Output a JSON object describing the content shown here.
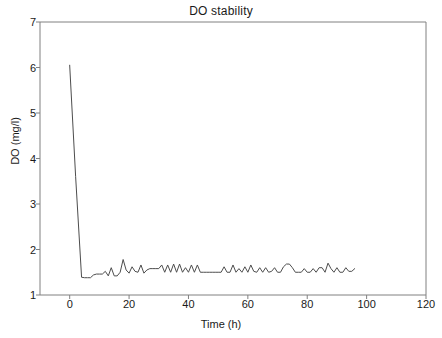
{
  "chart_data": {
    "type": "line",
    "title": "DO stability",
    "xlabel": "Time (h)",
    "ylabel": "DO (mg/l)",
    "xlim": [
      -10,
      120
    ],
    "ylim": [
      1,
      7
    ],
    "xticks": [
      0,
      20,
      40,
      60,
      80,
      100,
      120
    ],
    "xtick_labels": [
      "0",
      "20",
      "40",
      "60",
      "80",
      "100",
      "120"
    ],
    "yticks": [
      1,
      2,
      3,
      4,
      5,
      6,
      7
    ],
    "ytick_labels": [
      "1",
      "2",
      "3",
      "4",
      "5",
      "6",
      "7"
    ],
    "grid": false,
    "legend": false,
    "line_color": "#4d4d4d",
    "frame_color": "#808080",
    "series": [
      {
        "name": "DO",
        "x": [
          0,
          2,
          4,
          5,
          6,
          7,
          8,
          9,
          10,
          11,
          12,
          13,
          14,
          15,
          16,
          17,
          18,
          19,
          20,
          21,
          22,
          23,
          24,
          25,
          26,
          27,
          28,
          29,
          30,
          31,
          32,
          33,
          34,
          35,
          36,
          37,
          38,
          39,
          40,
          41,
          42,
          43,
          44,
          45,
          46,
          47,
          48,
          49,
          50,
          51,
          52,
          53,
          54,
          55,
          56,
          57,
          58,
          59,
          60,
          61,
          62,
          63,
          64,
          65,
          66,
          67,
          68,
          69,
          70,
          71,
          72,
          73,
          74,
          75,
          76,
          77,
          78,
          79,
          80,
          81,
          82,
          83,
          84,
          85,
          86,
          87,
          88,
          89,
          90,
          91,
          92,
          93,
          94,
          95,
          96
        ],
        "y": [
          6.05,
          3.6,
          1.39,
          1.38,
          1.38,
          1.38,
          1.44,
          1.46,
          1.46,
          1.46,
          1.52,
          1.42,
          1.6,
          1.42,
          1.42,
          1.5,
          1.78,
          1.55,
          1.48,
          1.62,
          1.52,
          1.5,
          1.66,
          1.48,
          1.55,
          1.58,
          1.58,
          1.58,
          1.58,
          1.66,
          1.5,
          1.66,
          1.5,
          1.68,
          1.5,
          1.68,
          1.5,
          1.6,
          1.5,
          1.66,
          1.5,
          1.66,
          1.5,
          1.5,
          1.5,
          1.5,
          1.5,
          1.5,
          1.5,
          1.5,
          1.62,
          1.5,
          1.5,
          1.66,
          1.5,
          1.58,
          1.5,
          1.62,
          1.5,
          1.66,
          1.52,
          1.5,
          1.6,
          1.5,
          1.6,
          1.5,
          1.52,
          1.6,
          1.5,
          1.5,
          1.62,
          1.68,
          1.68,
          1.6,
          1.5,
          1.5,
          1.5,
          1.58,
          1.5,
          1.5,
          1.58,
          1.5,
          1.6,
          1.6,
          1.5,
          1.7,
          1.58,
          1.5,
          1.6,
          1.5,
          1.5,
          1.6,
          1.52,
          1.52,
          1.58
        ]
      }
    ]
  },
  "axes": {
    "plot_left_px": 40,
    "plot_right_px": 426,
    "plot_top_px": 22,
    "plot_bottom_px": 295
  }
}
